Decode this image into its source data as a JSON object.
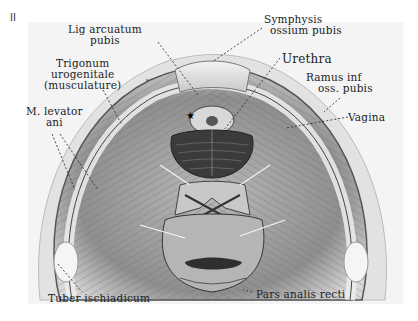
{
  "figure": {
    "number": "II",
    "labels": {
      "lig_arcuatum": [
        "Lig arcuatum",
        "pubis"
      ],
      "symphysis": [
        "Symphysis",
        "ossium pubis"
      ],
      "trigonum": [
        "Trigonum",
        "urogenitale",
        "(musculature)"
      ],
      "urethra": [
        "Urethra"
      ],
      "ramus": [
        "Ramus inf",
        "oss. pubis"
      ],
      "levator": [
        "M. levator",
        "ani"
      ],
      "vagina": [
        "Vagina"
      ],
      "tuber": [
        "Tuber ischiadicum"
      ],
      "pars_analis": [
        "Pars analis recti"
      ]
    },
    "marker": "★"
  }
}
